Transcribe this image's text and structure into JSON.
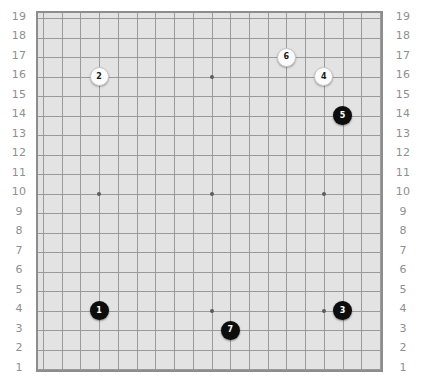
{
  "board": {
    "name": "go-board",
    "size": 19,
    "board_background_color": "#e3e3e3",
    "border_color": "#8d8d8d",
    "grid_line_color": "#9a9a9a",
    "page_background_color": "#ffffff",
    "star_point_color": "#5c5c5c",
    "row_labels": [
      "19",
      "18",
      "17",
      "16",
      "15",
      "14",
      "13",
      "12",
      "11",
      "10",
      "9",
      "8",
      "7",
      "6",
      "5",
      "4",
      "3",
      "2",
      "1"
    ],
    "star_points": [
      {
        "col": 4,
        "row": 16
      },
      {
        "col": 10,
        "row": 16
      },
      {
        "col": 16,
        "row": 16
      },
      {
        "col": 4,
        "row": 10
      },
      {
        "col": 10,
        "row": 10
      },
      {
        "col": 16,
        "row": 10
      },
      {
        "col": 4,
        "row": 4
      },
      {
        "col": 10,
        "row": 4
      },
      {
        "col": 16,
        "row": 4
      }
    ]
  },
  "stones": [
    {
      "label": "1",
      "color": "black",
      "col": 4,
      "row": 4
    },
    {
      "label": "2",
      "color": "white",
      "col": 4,
      "row": 16
    },
    {
      "label": "3",
      "color": "black",
      "col": 17,
      "row": 4
    },
    {
      "label": "4",
      "color": "white",
      "col": 16,
      "row": 16
    },
    {
      "label": "5",
      "color": "black",
      "col": 17,
      "row": 14
    },
    {
      "label": "6",
      "color": "white",
      "col": 14,
      "row": 17
    },
    {
      "label": "7",
      "color": "black",
      "col": 11,
      "row": 3
    }
  ]
}
